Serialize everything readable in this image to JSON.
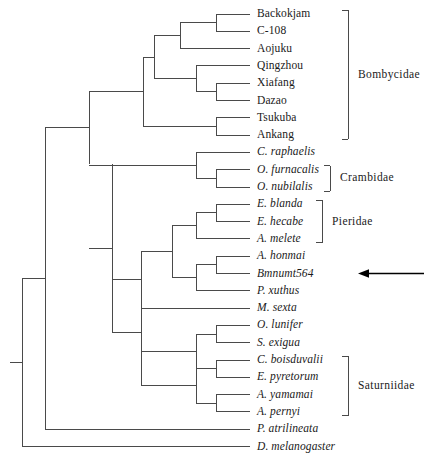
{
  "figure": {
    "type": "phylogenetic-tree",
    "layout": "rectangular-cladogram",
    "line_color": "#4a4a4a",
    "text_color": "#1a1a1a",
    "background_color": "#ffffff"
  },
  "tips": [
    {
      "id": "backokjam",
      "label": "Backokjam",
      "italic": false,
      "y": 14,
      "x_branch": 250
    },
    {
      "id": "c108",
      "label": "C-108",
      "italic": false,
      "y": 31.3,
      "x_branch": 250
    },
    {
      "id": "aojuku",
      "label": "Aojuku",
      "italic": false,
      "y": 48.6,
      "x_branch": 250
    },
    {
      "id": "qingzhou",
      "label": "Qingzhou",
      "italic": false,
      "y": 65.9,
      "x_branch": 250
    },
    {
      "id": "xiafang",
      "label": "Xiafang",
      "italic": false,
      "y": 83.2,
      "x_branch": 250
    },
    {
      "id": "dazao",
      "label": "Dazao",
      "italic": false,
      "y": 100.5,
      "x_branch": 250
    },
    {
      "id": "tsukuba",
      "label": "Tsukuba",
      "italic": false,
      "y": 117.8,
      "x_branch": 250
    },
    {
      "id": "ankang",
      "label": "Ankang",
      "italic": false,
      "y": 135.1,
      "x_branch": 250
    },
    {
      "id": "c-raphaelis",
      "label": "C. raphaelis",
      "italic": true,
      "y": 152.4,
      "x_branch": 250
    },
    {
      "id": "o-furnacalis",
      "label": "O. furnacalis",
      "italic": true,
      "y": 169.7,
      "x_branch": 250
    },
    {
      "id": "o-nubilalis",
      "label": "O. nubilalis",
      "italic": true,
      "y": 187.0,
      "x_branch": 250
    },
    {
      "id": "e-blanda",
      "label": "E. blanda",
      "italic": true,
      "y": 204.3,
      "x_branch": 250
    },
    {
      "id": "e-hecabe",
      "label": "E. hecabe",
      "italic": true,
      "y": 221.6,
      "x_branch": 250
    },
    {
      "id": "a-melete",
      "label": "A. melete",
      "italic": true,
      "y": 238.9,
      "x_branch": 250
    },
    {
      "id": "a-honmai",
      "label": "A. honmai",
      "italic": true,
      "y": 256.2,
      "x_branch": 250
    },
    {
      "id": "bmnumt564",
      "label": "Bmnumt564",
      "italic": true,
      "y": 273.5,
      "x_branch": 250
    },
    {
      "id": "p-xuthus",
      "label": "P. xuthus",
      "italic": true,
      "y": 290.8,
      "x_branch": 250
    },
    {
      "id": "m-sexta",
      "label": "M. sexta",
      "italic": true,
      "y": 308.1,
      "x_branch": 250
    },
    {
      "id": "o-lunifer",
      "label": "O. lunifer",
      "italic": true,
      "y": 325.4,
      "x_branch": 250
    },
    {
      "id": "s-exigua",
      "label": "S. exigua",
      "italic": true,
      "y": 342.7,
      "x_branch": 250
    },
    {
      "id": "c-boisduvalii",
      "label": "C. boisduvalii",
      "italic": true,
      "y": 360.0,
      "x_branch": 250
    },
    {
      "id": "e-pyretorum",
      "label": "E. pyretorum",
      "italic": true,
      "y": 377.3,
      "x_branch": 250
    },
    {
      "id": "a-yamamai",
      "label": "A. yamamai",
      "italic": true,
      "y": 394.6,
      "x_branch": 250
    },
    {
      "id": "a-pernyi",
      "label": "A. pernyi",
      "italic": true,
      "y": 411.9,
      "x_branch": 250
    },
    {
      "id": "p-atrilineata",
      "label": "P. atrilineata",
      "italic": true,
      "y": 429.2,
      "x_branch": 250
    },
    {
      "id": "d-melanogaster",
      "label": "D. melanogaster",
      "italic": true,
      "y": 446.5,
      "x_branch": 250
    }
  ],
  "tip_label_x": 257,
  "internal_nodes": [
    {
      "id": "n-backokjam-c108",
      "x": 216,
      "y_top": 14,
      "y_bottom": 31.3,
      "x_parent": 180
    },
    {
      "id": "n-xiafang-dazao",
      "x": 216,
      "y_top": 83.2,
      "y_bottom": 100.5,
      "x_parent": 196
    },
    {
      "id": "n-tsukuba-ankang",
      "x": 216,
      "y_top": 117.8,
      "y_bottom": 135.1,
      "x_parent": 143
    },
    {
      "id": "n-bomb-upper",
      "x": 180,
      "y_top": 22.6,
      "y_bottom": 48.6,
      "x_parent": 154
    },
    {
      "id": "n-bomb-lower",
      "x": 196,
      "y_top": 65.9,
      "y_bottom": 91.8,
      "x_parent": 154
    },
    {
      "id": "n-bomb-core",
      "x": 154,
      "y_top": 35.6,
      "y_bottom": 78.8,
      "x_parent": 143
    },
    {
      "id": "n-bombycidae",
      "x": 143,
      "y_top": 57.2,
      "y_bottom": 126.4,
      "x_parent": 89
    },
    {
      "id": "n-crambidae",
      "x": 216,
      "y_top": 169.7,
      "y_bottom": 187.0,
      "x_parent": 196
    },
    {
      "id": "n-cramb-raph",
      "x": 196,
      "y_top": 152.4,
      "y_bottom": 178.3,
      "x_parent": 89
    },
    {
      "id": "n-eurema",
      "x": 216,
      "y_top": 204.3,
      "y_bottom": 221.6,
      "x_parent": 196
    },
    {
      "id": "n-pieridae",
      "x": 196,
      "y_top": 212.9,
      "y_bottom": 238.9,
      "x_parent": 172
    },
    {
      "id": "n-honmai-bmnumt",
      "x": 216,
      "y_top": 256.2,
      "y_bottom": 273.5,
      "x_parent": 196
    },
    {
      "id": "n-torticoid",
      "x": 196,
      "y_top": 264.8,
      "y_bottom": 290.8,
      "x_parent": 172
    },
    {
      "id": "n-pier-papil",
      "x": 172,
      "y_top": 225.9,
      "y_bottom": 277.8,
      "x_parent": 141
    },
    {
      "id": "n-msexta-clade",
      "x": 141,
      "y_top": 251.8,
      "y_bottom": 308.1,
      "x_parent": 112
    },
    {
      "id": "n-lunifer-exigua",
      "x": 216,
      "y_top": 325.4,
      "y_bottom": 342.7,
      "x_parent": 196
    },
    {
      "id": "n-noctuoid",
      "x": 196,
      "y_top": 334.0,
      "y_bottom": 368.6,
      "x_parent": 141
    },
    {
      "id": "n-boisd-pyret",
      "x": 216,
      "y_top": 360.0,
      "y_bottom": 377.3,
      "x_parent": 196
    },
    {
      "id": "n-antheraea",
      "x": 216,
      "y_top": 394.6,
      "y_bottom": 411.9,
      "x_parent": 196
    },
    {
      "id": "n-saturniidae",
      "x": 196,
      "y_top": 368.6,
      "y_bottom": 403.2,
      "x_parent": 141
    },
    {
      "id": "n-bigclade",
      "x": 141,
      "y_top": 280.0,
      "y_bottom": 385.9,
      "x_parent": 112
    },
    {
      "id": "n-macroheterocera",
      "x": 112,
      "y_top": 164.0,
      "y_bottom": 333.0,
      "x_parent": 89
    },
    {
      "id": "n-lepidoptera-core",
      "x": 89,
      "y_top": 91.8,
      "y_bottom": 164.0,
      "x_parent": 45
    },
    {
      "id": "n-with-atrilineata",
      "x": 45,
      "y_top": 127.9,
      "y_bottom": 429.2,
      "x_parent": 22
    },
    {
      "id": "n-root",
      "x": 22,
      "y_top": 278.5,
      "y_bottom": 446.5,
      "x_parent": 10
    }
  ],
  "clade_brackets": [
    {
      "id": "bombycidae",
      "label": "Bombycidae",
      "y_top": 14,
      "y_bottom": 135.1,
      "x": 348,
      "label_x": 358
    },
    {
      "id": "crambidae",
      "label": "Crambidae",
      "y_top": 169.7,
      "y_bottom": 187.0,
      "x": 330,
      "label_x": 340
    },
    {
      "id": "pieridae",
      "label": "Pieridae",
      "y_top": 204.3,
      "y_bottom": 238.9,
      "x": 322,
      "label_x": 332
    },
    {
      "id": "saturniidae",
      "label": "Saturniidae",
      "y_top": 360.0,
      "y_bottom": 411.9,
      "x": 348,
      "label_x": 358
    }
  ],
  "annotation_arrow": {
    "target_tip": "bmnumt564",
    "y": 273.5,
    "x_tail": 424,
    "x_head": 358,
    "direction": "left"
  }
}
